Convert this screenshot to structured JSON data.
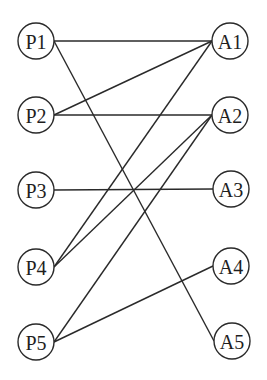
{
  "diagram": {
    "type": "bipartite-graph",
    "left_nodes": [
      {
        "id": "P1",
        "label": "P1",
        "x": 36,
        "y": 41
      },
      {
        "id": "P2",
        "label": "P2",
        "x": 36,
        "y": 115
      },
      {
        "id": "P3",
        "label": "P3",
        "x": 36,
        "y": 190
      },
      {
        "id": "P4",
        "label": "P4",
        "x": 36,
        "y": 267
      },
      {
        "id": "P5",
        "label": "P5",
        "x": 36,
        "y": 342
      }
    ],
    "right_nodes": [
      {
        "id": "A1",
        "label": "A1",
        "x": 230,
        "y": 41
      },
      {
        "id": "A2",
        "label": "A2",
        "x": 230,
        "y": 115
      },
      {
        "id": "A3",
        "label": "A3",
        "x": 231,
        "y": 189
      },
      {
        "id": "A4",
        "label": "A4",
        "x": 231,
        "y": 266
      },
      {
        "id": "A5",
        "label": "A5",
        "x": 232,
        "y": 341
      }
    ],
    "edges": [
      {
        "from": "P1",
        "to": "A1"
      },
      {
        "from": "P1",
        "to": "A5"
      },
      {
        "from": "P2",
        "to": "A1"
      },
      {
        "from": "P2",
        "to": "A2"
      },
      {
        "from": "P3",
        "to": "A3"
      },
      {
        "from": "P4",
        "to": "A1"
      },
      {
        "from": "P4",
        "to": "A2"
      },
      {
        "from": "P5",
        "to": "A2"
      },
      {
        "from": "P5",
        "to": "A4"
      }
    ],
    "node_radius": 18,
    "colors": {
      "stroke": "#2a2a2a",
      "background": "#ffffff",
      "text": "#1e1e1e"
    }
  }
}
